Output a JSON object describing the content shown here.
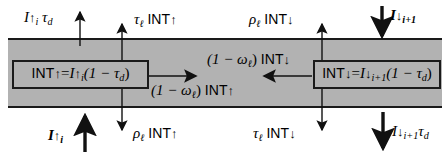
{
  "figure": {
    "type": "radiative-transfer-layer-diagram",
    "slab_color": "#b2b2b2",
    "line_color": "#1a1a1a",
    "background": "#ffffff"
  },
  "boxes": {
    "left": {
      "name": "upward-intensity-equation",
      "lhs": "INT",
      "lhs_arrow": "↑",
      "equals": "=",
      "rhs_symbol": "I",
      "rhs_arrow": "↑",
      "rhs_subscript": "i",
      "rhs_factor": "(1 − τ",
      "rhs_factor_sub": "d",
      "rhs_close": ")"
    },
    "right": {
      "name": "downward-intensity-equation",
      "lhs": "INT",
      "lhs_arrow": "↓",
      "equals": "=",
      "rhs_symbol": "I",
      "rhs_arrow": "↓",
      "rhs_subscript": "i+1",
      "rhs_factor": "(1 − τ",
      "rhs_factor_sub": "d",
      "rhs_close": ")"
    }
  },
  "labels": {
    "top_left_direct": {
      "symbol": "I",
      "arrow": "↑",
      "sub": "i",
      "factor": "τ",
      "factor_sub": "d"
    },
    "top_left_diffuse": {
      "factor": "τ",
      "factor_sub": "ℓ",
      "term": "INT",
      "arrow": "↑"
    },
    "top_right_reflect": {
      "factor": "ρ",
      "factor_sub": "ℓ",
      "term": "INT",
      "arrow": "↓"
    },
    "top_right_incident": {
      "symbol": "I",
      "arrow": "↓",
      "sub": "i+1"
    },
    "mid_left_scatter": {
      "factor": "(1 − ω",
      "factor_sub": "ℓ",
      "close": ")",
      "term": "INT",
      "arrow": "↑"
    },
    "mid_right_scatter": {
      "factor": "(1 − ω",
      "factor_sub": "ℓ",
      "close": ")",
      "term": "INT",
      "arrow": "↓"
    },
    "bottom_left_incident": {
      "symbol": "I",
      "arrow": "↑",
      "sub": "i"
    },
    "bottom_left_reflect": {
      "factor": "ρ",
      "factor_sub": "ℓ",
      "term": "INT",
      "arrow": "↑"
    },
    "bottom_right_transmit": {
      "factor": "τ",
      "factor_sub": "ℓ",
      "term": "INT",
      "arrow": "↓"
    },
    "bottom_right_direct": {
      "symbol": "I",
      "arrow": "↓",
      "sub": "i+1",
      "factor": "τ",
      "factor_sub": "d"
    }
  }
}
